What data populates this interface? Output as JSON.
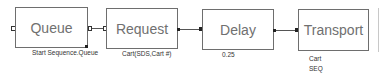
{
  "blocks": [
    {
      "name": "Queue",
      "label": "Start Sequence.Queue"
    },
    {
      "name": "Request",
      "label": "Cart(SDS,Cart #)"
    },
    {
      "name": "Delay",
      "label": "0.25"
    },
    {
      "name": "Transport",
      "label_lines": [
        "Cart",
        "SEQ"
      ]
    }
  ],
  "colors": {
    "block_border": "#6e6e6e",
    "block_text": "#707070",
    "wire": "#555555"
  }
}
